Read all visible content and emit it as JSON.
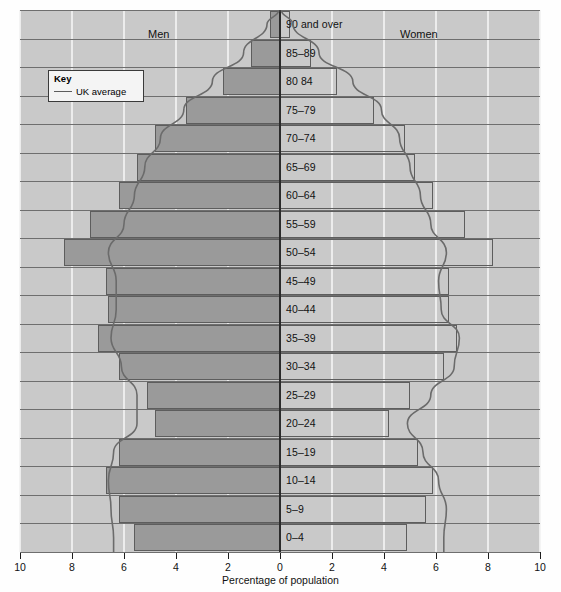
{
  "captions": {
    "men": "Men",
    "women": "Women"
  },
  "key": {
    "title": "Key",
    "series_label": "UK average",
    "line_color": "#5d5d5d"
  },
  "axis": {
    "title": "Percentage of population",
    "tick_labels": [
      "10",
      "8",
      "6",
      "4",
      "2",
      "0",
      "2",
      "4",
      "6",
      "8",
      "10"
    ]
  },
  "colors": {
    "plot_background": "#c9c9c9",
    "men_bar_fill": "#9a9a9a",
    "bar_stroke": "#5d5d5d",
    "gridline": "#f2f2f2",
    "centre_axis": "#2b2b2b"
  },
  "chart_data": {
    "type": "bar",
    "subtype": "population-pyramid",
    "title": "",
    "xlabel": "Percentage of population",
    "ylabel": "",
    "xlim": [
      -10,
      10
    ],
    "x_ticks": [
      -10,
      -8,
      -6,
      -4,
      -2,
      0,
      2,
      4,
      6,
      8,
      10
    ],
    "x_tick_labels": [
      "10",
      "8",
      "6",
      "4",
      "2",
      "0",
      "2",
      "4",
      "6",
      "8",
      "10"
    ],
    "grid": true,
    "legend": [
      "UK average"
    ],
    "legend_position": "upper-left",
    "categories": [
      "90 and over",
      "85–89",
      "80 84",
      "75–79",
      "70–74",
      "65–69",
      "60–64",
      "55–59",
      "50–54",
      "45–49",
      "40–44",
      "35–39",
      "30–34",
      "25–29",
      "20–24",
      "15–19",
      "10–14",
      "5–9",
      "0–4"
    ],
    "series": [
      {
        "name": "Men",
        "side": "left",
        "values": [
          0.4,
          1.1,
          2.2,
          3.6,
          4.8,
          5.5,
          6.2,
          7.3,
          8.3,
          6.7,
          6.6,
          7.0,
          6.2,
          5.1,
          4.8,
          6.2,
          6.7,
          6.2,
          5.6
        ]
      },
      {
        "name": "Women",
        "side": "right",
        "values": [
          0.4,
          1.2,
          2.2,
          3.6,
          4.8,
          5.2,
          5.9,
          7.1,
          8.2,
          6.5,
          6.5,
          6.8,
          6.3,
          5.0,
          4.2,
          5.3,
          5.9,
          5.6,
          4.9
        ]
      }
    ],
    "uk_average_curve": {
      "name": "UK average",
      "left_values": [
        0.5,
        1.4,
        2.6,
        3.7,
        4.6,
        5.2,
        5.6,
        6.0,
        6.6,
        6.3,
        6.3,
        6.5,
        6.1,
        5.5,
        5.5,
        6.4,
        6.6,
        6.5,
        6.4
      ],
      "right_values": [
        0.5,
        1.5,
        2.8,
        3.9,
        4.6,
        5.0,
        5.4,
        5.8,
        6.4,
        6.1,
        6.2,
        6.9,
        6.7,
        5.8,
        4.9,
        5.5,
        6.1,
        6.4,
        6.3
      ]
    }
  }
}
